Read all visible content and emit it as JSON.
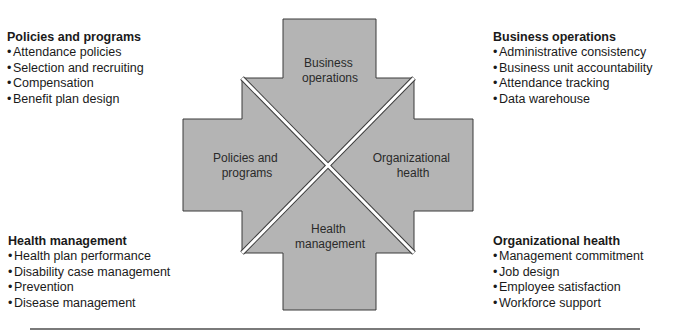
{
  "diagram": {
    "fill_color": "#b4b4b4",
    "stroke_color": "#3a3a3a",
    "quadrants": {
      "top": {
        "line1": "Business",
        "line2": "operations"
      },
      "left": {
        "line1": "Policies and",
        "line2": "programs"
      },
      "right": {
        "line1": "Organizational",
        "line2": "health"
      },
      "bottom": {
        "line1": "Health",
        "line2": "management"
      }
    }
  },
  "blocks": {
    "top_left": {
      "title": "Policies and programs",
      "items": [
        "Attendance policies",
        "Selection and recruiting",
        "Compensation",
        "Benefit plan design"
      ]
    },
    "top_right": {
      "title": "Business operations",
      "items": [
        "Administrative consistency",
        "Business unit accountability",
        "Attendance tracking",
        "Data warehouse"
      ]
    },
    "bottom_left": {
      "title": "Health management",
      "items": [
        "Health plan performance",
        "Disability case management",
        "Prevention",
        "Disease management"
      ]
    },
    "bottom_right": {
      "title": "Organizational health",
      "items": [
        "Management commitment",
        "Job design",
        "Employee satisfaction",
        "Workforce support"
      ]
    }
  },
  "bullet": "•"
}
